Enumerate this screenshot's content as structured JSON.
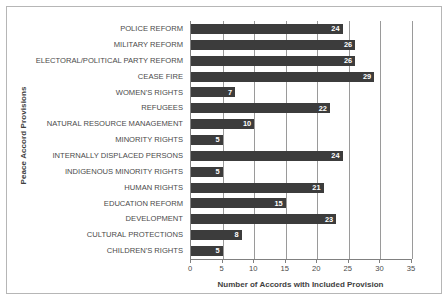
{
  "chart_data": {
    "type": "bar",
    "orientation": "horizontal",
    "title": "",
    "xlabel": "Number of Accords with Included Provision",
    "ylabel": "Peace Accord Provisions",
    "xlim": [
      0,
      35
    ],
    "xticks": [
      0,
      5,
      10,
      15,
      20,
      25,
      30,
      35
    ],
    "grid": true,
    "legend": "none",
    "bar_color": "#3c3c3c",
    "data_label_color": "#ffffff",
    "categories": [
      "POLICE REFORM",
      "MILITARY REFORM",
      "ELECTORAL/POLITICAL PARTY REFORM",
      "CEASE FIRE",
      "WOMEN'S RIGHTS",
      "REFUGEES",
      "NATURAL RESOURCE MANAGEMENT",
      "MINORITY RIGHTS",
      "INTERNALLY DISPLACED PERSONS",
      "INDIGENOUS MINORITY RIGHTS",
      "HUMAN RIGHTS",
      "EDUCATION REFORM",
      "DEVELOPMENT",
      "CULTURAL PROTECTIONS",
      "CHILDREN'S RIGHTS"
    ],
    "values": [
      24,
      26,
      26,
      29,
      7,
      22,
      10,
      5,
      24,
      5,
      21,
      15,
      23,
      8,
      5
    ]
  }
}
